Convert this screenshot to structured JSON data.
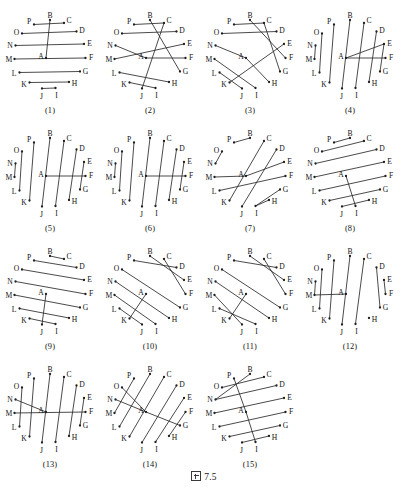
{
  "figure": {
    "caption_glyph": "box-tofu-glyph",
    "caption_text": "7.5",
    "caption_full": "図 7.5"
  },
  "geometry": {
    "note": "16 vertices A-P placed around an ellipse; A is the first vertex at the interior-left-of-center position, remaining letters run counter-clockwise from B at top.",
    "cx": 50,
    "cy": 50,
    "rx": 36,
    "ry": 38,
    "vertices": [
      {
        "id": "A",
        "x": 46.0,
        "y": 52.0,
        "lx": 41.0,
        "ly": 50.0
      },
      {
        "id": "B",
        "x": 50.0,
        "y": 14.0,
        "lx": 50.0,
        "ly": 9.0
      },
      {
        "id": "C",
        "x": 64.0,
        "y": 17.0,
        "lx": 69.0,
        "ly": 14.0
      },
      {
        "id": "D",
        "x": 76.5,
        "y": 25.5,
        "lx": 82.0,
        "ly": 24.0
      },
      {
        "id": "E",
        "x": 84.0,
        "y": 38.0,
        "lx": 89.5,
        "ly": 37.0
      },
      {
        "id": "F",
        "x": 85.5,
        "y": 52.0,
        "lx": 91.0,
        "ly": 51.5
      },
      {
        "id": "G",
        "x": 80.0,
        "y": 65.5,
        "lx": 85.5,
        "ly": 65.5
      },
      {
        "id": "H",
        "x": 69.0,
        "y": 76.0,
        "lx": 74.5,
        "ly": 77.0
      },
      {
        "id": "I",
        "x": 55.5,
        "y": 82.0,
        "lx": 56.5,
        "ly": 89.0
      },
      {
        "id": "J",
        "x": 42.0,
        "y": 82.5,
        "lx": 41.5,
        "ly": 90.0
      },
      {
        "id": "K",
        "x": 29.5,
        "y": 76.5,
        "lx": 24.0,
        "ly": 78.0
      },
      {
        "id": "L",
        "x": 19.5,
        "y": 66.5,
        "lx": 14.0,
        "ly": 67.5
      },
      {
        "id": "M",
        "x": 14.5,
        "y": 53.0,
        "lx": 9.0,
        "ly": 53.0
      },
      {
        "id": "N",
        "x": 15.5,
        "y": 39.5,
        "lx": 10.0,
        "ly": 39.0
      },
      {
        "id": "O",
        "x": 22.0,
        "y": 27.5,
        "lx": 16.5,
        "ly": 26.0
      },
      {
        "id": "P",
        "x": 34.0,
        "y": 18.5,
        "lx": 29.0,
        "ly": 15.5
      }
    ]
  },
  "diagrams": [
    {
      "index": 1,
      "label": "(1)",
      "matching": [
        [
          "B",
          "A"
        ],
        [
          "P",
          "C"
        ],
        [
          "O",
          "D"
        ],
        [
          "N",
          "E"
        ],
        [
          "M",
          "F"
        ],
        [
          "L",
          "G"
        ],
        [
          "K",
          "H"
        ],
        [
          "J",
          "I"
        ]
      ]
    },
    {
      "index": 2,
      "label": "(2)",
      "matching": [
        [
          "B",
          "G"
        ],
        [
          "P",
          "C"
        ],
        [
          "O",
          "D"
        ],
        [
          "N",
          "A"
        ],
        [
          "A",
          "F"
        ],
        [
          "M",
          "E"
        ],
        [
          "L",
          "H"
        ],
        [
          "K",
          "I"
        ],
        [
          "C",
          "J"
        ]
      ]
    },
    {
      "index": 3,
      "label": "(3)",
      "matching": [
        [
          "P",
          "C"
        ],
        [
          "B",
          "F"
        ],
        [
          "O",
          "D"
        ],
        [
          "C",
          "G"
        ],
        [
          "N",
          "A"
        ],
        [
          "A",
          "H"
        ],
        [
          "M",
          "I"
        ],
        [
          "L",
          "J"
        ],
        [
          "K",
          "E"
        ]
      ]
    },
    {
      "index": 4,
      "label": "(4)",
      "matching": [
        [
          "P",
          "K"
        ],
        [
          "B",
          "J"
        ],
        [
          "C",
          "I"
        ],
        [
          "O",
          "L"
        ],
        [
          "N",
          "M"
        ],
        [
          "D",
          "H"
        ],
        [
          "A",
          "E"
        ],
        [
          "E",
          "G"
        ],
        [
          "F",
          "A"
        ]
      ]
    },
    {
      "index": 5,
      "label": "(5)",
      "matching": [
        [
          "P",
          "K"
        ],
        [
          "B",
          "J"
        ],
        [
          "C",
          "I"
        ],
        [
          "O",
          "L"
        ],
        [
          "N",
          "M"
        ],
        [
          "D",
          "H"
        ],
        [
          "A",
          "F"
        ],
        [
          "E",
          "G"
        ]
      ]
    },
    {
      "index": 6,
      "label": "(6)",
      "matching": [
        [
          "P",
          "K"
        ],
        [
          "B",
          "J"
        ],
        [
          "C",
          "I"
        ],
        [
          "O",
          "L"
        ],
        [
          "N",
          "M"
        ],
        [
          "D",
          "H"
        ],
        [
          "A",
          "F"
        ],
        [
          "E",
          "G"
        ]
      ]
    },
    {
      "index": 7,
      "label": "(7)",
      "matching": [
        [
          "P",
          "B"
        ],
        [
          "O",
          "N"
        ],
        [
          "C",
          "K"
        ],
        [
          "D",
          "J"
        ],
        [
          "M",
          "A"
        ],
        [
          "A",
          "E"
        ],
        [
          "L",
          "F"
        ],
        [
          "I",
          "G"
        ],
        [
          "H",
          "I"
        ]
      ]
    },
    {
      "index": 8,
      "label": "(8)",
      "matching": [
        [
          "P",
          "B"
        ],
        [
          "O",
          "C"
        ],
        [
          "N",
          "D"
        ],
        [
          "M",
          "E"
        ],
        [
          "L",
          "F"
        ],
        [
          "K",
          "G"
        ],
        [
          "J",
          "H"
        ],
        [
          "A",
          "I"
        ]
      ]
    },
    {
      "index": 9,
      "label": "(9)",
      "matching": [
        [
          "B",
          "C"
        ],
        [
          "P",
          "D"
        ],
        [
          "O",
          "E"
        ],
        [
          "N",
          "F"
        ],
        [
          "M",
          "G"
        ],
        [
          "L",
          "H"
        ],
        [
          "K",
          "I"
        ],
        [
          "A",
          "J"
        ]
      ]
    },
    {
      "index": 10,
      "label": "(10)",
      "matching": [
        [
          "P",
          "D"
        ],
        [
          "B",
          "E"
        ],
        [
          "C",
          "F"
        ],
        [
          "O",
          "G"
        ],
        [
          "N",
          "H"
        ],
        [
          "A",
          "K"
        ],
        [
          "M",
          "I"
        ],
        [
          "L",
          "J"
        ]
      ]
    },
    {
      "index": 11,
      "label": "(11)",
      "matching": [
        [
          "P",
          "D"
        ],
        [
          "B",
          "E"
        ],
        [
          "C",
          "F"
        ],
        [
          "O",
          "G"
        ],
        [
          "N",
          "H"
        ],
        [
          "A",
          "K"
        ],
        [
          "M",
          "J"
        ],
        [
          "L",
          "I"
        ]
      ]
    },
    {
      "index": 12,
      "label": "(12)",
      "matching": [
        [
          "P",
          "K"
        ],
        [
          "B",
          "J"
        ],
        [
          "C",
          "I"
        ],
        [
          "O",
          "L"
        ],
        [
          "N",
          "M"
        ],
        [
          "D",
          "G"
        ],
        [
          "E",
          "F"
        ],
        [
          "M",
          "A"
        ]
      ]
    },
    {
      "index": 13,
      "label": "(13)",
      "matching": [
        [
          "P",
          "K"
        ],
        [
          "B",
          "J"
        ],
        [
          "C",
          "I"
        ],
        [
          "O",
          "L"
        ],
        [
          "D",
          "H"
        ],
        [
          "N",
          "A"
        ],
        [
          "E",
          "G"
        ],
        [
          "F",
          "M"
        ]
      ]
    },
    {
      "index": 14,
      "label": "(14)",
      "matching": [
        [
          "P",
          "M"
        ],
        [
          "B",
          "L"
        ],
        [
          "O",
          "A"
        ],
        [
          "C",
          "K"
        ],
        [
          "D",
          "J"
        ],
        [
          "N",
          "A"
        ],
        [
          "E",
          "I"
        ],
        [
          "F",
          "H"
        ],
        [
          "A",
          "G"
        ]
      ]
    },
    {
      "index": 15,
      "label": "(15)",
      "matching": [
        [
          "P",
          "A"
        ],
        [
          "O",
          "C"
        ],
        [
          "B",
          "N"
        ],
        [
          "N",
          "D"
        ],
        [
          "M",
          "E"
        ],
        [
          "L",
          "F"
        ],
        [
          "K",
          "G"
        ],
        [
          "J",
          "H"
        ],
        [
          "A",
          "I"
        ]
      ]
    }
  ],
  "style": {
    "stroke_color": "#2b2b2b",
    "vertex_color": "#1f1f1f",
    "text_color": "#141414",
    "background": "#ffffff"
  }
}
